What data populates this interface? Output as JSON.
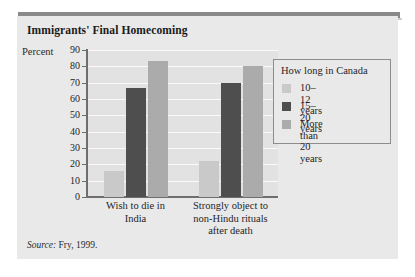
{
  "title": "Immigrants' Final Homecoming",
  "source_prefix": "Source:",
  "source_text": "Fry, 1999.",
  "legend": {
    "title": "How long in Canada",
    "entries": [
      {
        "label": "10–12 years",
        "color": "#c9c9c9"
      },
      {
        "label": "15–20 years",
        "color": "#4e4e4e"
      },
      {
        "label": "More than\n20 years",
        "color": "#ababab"
      }
    ]
  },
  "chart_data": {
    "type": "bar",
    "title": "Immigrants' Final Homecoming",
    "xlabel": "",
    "ylabel": "Percent",
    "ylim": [
      0,
      90
    ],
    "yticks": [
      0,
      10,
      20,
      30,
      40,
      50,
      60,
      70,
      80,
      90
    ],
    "ytick_labels": [
      "0",
      "10",
      "20",
      "30",
      "40",
      "50",
      "60",
      "70",
      "80",
      "90"
    ],
    "grid": true,
    "legend_position": "right",
    "categories": [
      "Wish to die in\nIndia",
      "Strongly object to\nnon-Hindu rituals\nafter death"
    ],
    "series": [
      {
        "name": "10–12 years",
        "color": "#c9c9c9",
        "values": [
          16,
          22
        ]
      },
      {
        "name": "15–20 years",
        "color": "#4e4e4e",
        "values": [
          67,
          70
        ]
      },
      {
        "name": "More than 20 years",
        "color": "#ababab",
        "values": [
          83,
          80
        ]
      }
    ]
  }
}
